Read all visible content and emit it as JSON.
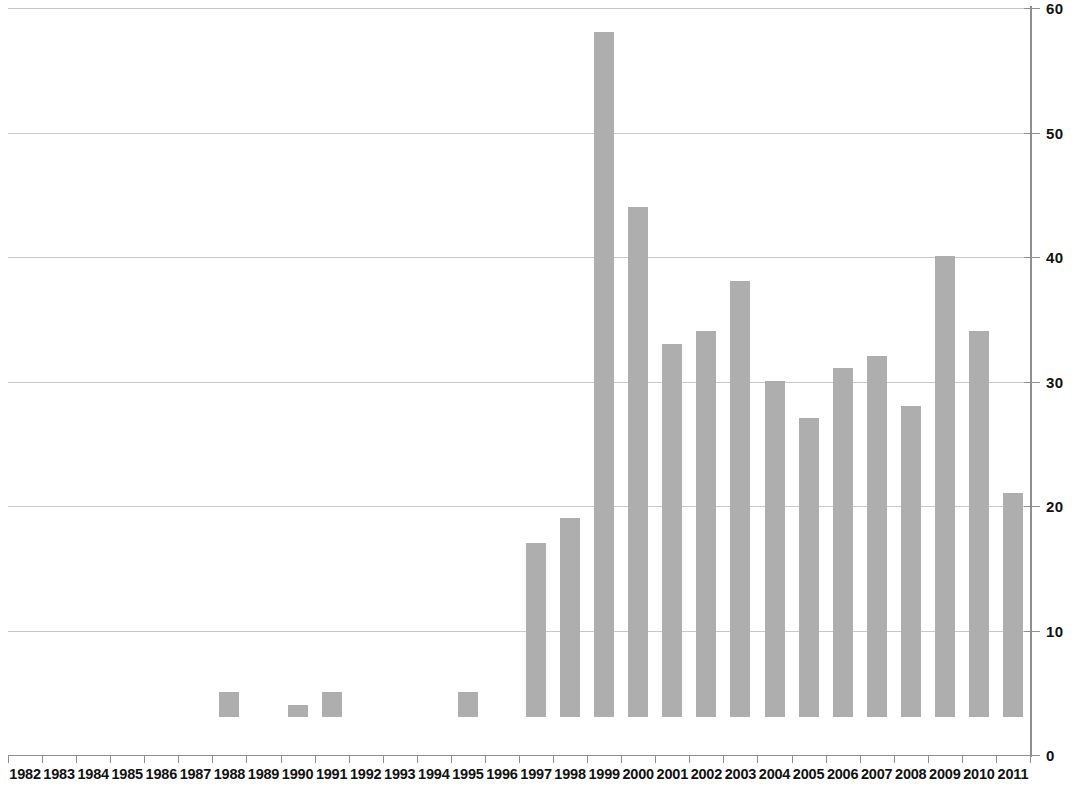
{
  "chart_data": {
    "type": "bar",
    "title": "",
    "subtitle": "",
    "xlabel": "",
    "ylabel": "",
    "categories": [
      "1982",
      "1983",
      "1984",
      "1985",
      "1986",
      "1987",
      "1988",
      "1989",
      "1990",
      "1991",
      "1992",
      "1993",
      "1994",
      "1995",
      "1996",
      "1997",
      "1998",
      "1999",
      "2000",
      "2001",
      "2002",
      "2003",
      "2004",
      "2005",
      "2006",
      "2007",
      "2008",
      "2009",
      "2010",
      "2011"
    ],
    "values": [
      0,
      0,
      0,
      0,
      0,
      0,
      2,
      0,
      1,
      2,
      0,
      0,
      0,
      2,
      0,
      14,
      16,
      55,
      41,
      30,
      31,
      35,
      27,
      24,
      28,
      29,
      25,
      37,
      31,
      18
    ],
    "series": [
      {
        "name": "",
        "values": [
          0,
          0,
          0,
          0,
          0,
          0,
          2,
          0,
          1,
          2,
          0,
          0,
          0,
          2,
          0,
          14,
          16,
          55,
          41,
          30,
          31,
          35,
          27,
          24,
          28,
          29,
          25,
          37,
          31,
          18
        ]
      }
    ],
    "ylim": [
      0,
      60
    ],
    "yticks": [
      0,
      10,
      20,
      30,
      40,
      50,
      60
    ],
    "ytick_labels": [
      "0",
      "10",
      "20",
      "30",
      "40",
      "50",
      "60"
    ],
    "y_axis_position": "right",
    "grid": true,
    "grid_axis": "y",
    "legend": false,
    "legend_position": "none",
    "bar_color": "#aeaeae",
    "grid_color": "#c8c8c8",
    "axis_color": "#8f8f8f",
    "text_color": "#111111",
    "background": "#ffffff",
    "annotations": []
  }
}
